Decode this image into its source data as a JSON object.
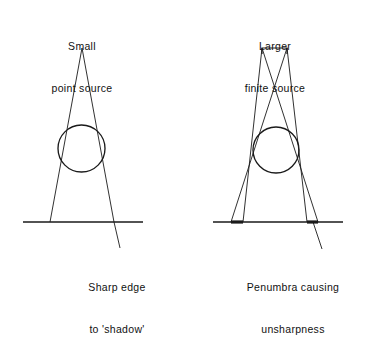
{
  "figure": {
    "background_color": "#ffffff",
    "ink_color": "#1a1a1a",
    "width": 370,
    "height": 288
  },
  "panels": [
    {
      "id": "left",
      "name": "point-source-panel",
      "top_label": {
        "line1": "Small",
        "line2": "point source"
      },
      "bottom_label": {
        "line1": "Sharp edge",
        "line2": "to 'shadow'"
      },
      "source": {
        "type": "point",
        "x": 82,
        "y": 48
      },
      "object": {
        "type": "circle",
        "cx": 81.5,
        "cy": 148.5,
        "r": 23.5
      },
      "ground": {
        "y": 222,
        "x1": 23,
        "x2": 143
      },
      "rays": [
        {
          "x1": 82,
          "y1": 48,
          "x2": 50,
          "y2": 222
        },
        {
          "x1": 82,
          "y1": 48,
          "x2": 114,
          "y2": 222
        }
      ],
      "pointer": {
        "x1": 114,
        "y1": 222,
        "x2": 120,
        "y2": 248
      }
    },
    {
      "id": "right",
      "name": "finite-source-panel",
      "top_label": {
        "line1": "Larger",
        "line2": "finite source"
      },
      "bottom_label": {
        "line1": "Penumbra causing",
        "line2": "unsharpness"
      },
      "source": {
        "type": "bar",
        "x1": 262,
        "x2": 287,
        "y": 48,
        "height": 6
      },
      "object": {
        "type": "circle",
        "cx": 276,
        "cy": 150,
        "r": 23
      },
      "ground": {
        "y": 222,
        "x1": 213,
        "x2": 343
      },
      "rays": [
        {
          "x1": 262,
          "y1": 48,
          "x2": 243,
          "y2": 222
        },
        {
          "x1": 262,
          "y1": 48,
          "x2": 318,
          "y2": 222
        },
        {
          "x1": 287,
          "y1": 48,
          "x2": 231,
          "y2": 222
        },
        {
          "x1": 287,
          "y1": 48,
          "x2": 307,
          "y2": 222
        }
      ],
      "penumbra_bands": [
        {
          "x1": 231,
          "x2": 243,
          "y": 222
        },
        {
          "x1": 307,
          "x2": 318,
          "y": 222
        }
      ],
      "pointer": {
        "x1": 313,
        "y1": 222,
        "x2": 322,
        "y2": 249
      }
    }
  ]
}
